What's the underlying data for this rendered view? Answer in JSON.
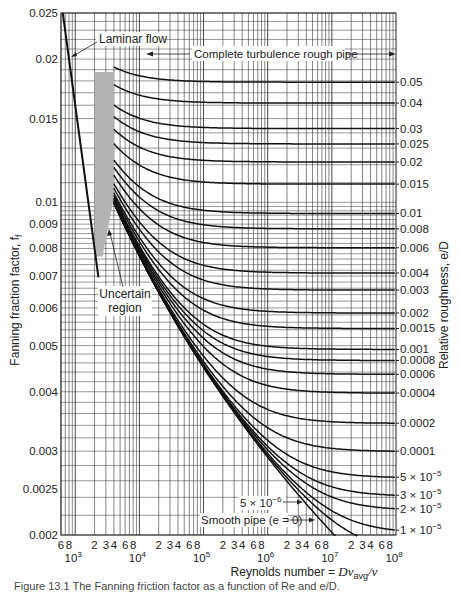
{
  "chart_data": {
    "type": "line",
    "title": "",
    "xlabel": "Reynolds number = Dv_avg/ν",
    "ylabel": "Fanning fraction factor, f_f",
    "y2label": "Relative roughness, e/D",
    "xscale": "log",
    "yscale": "log",
    "xlim": [
      600,
      100000000
    ],
    "ylim": [
      0.002,
      0.025
    ],
    "grid": true,
    "y_ticks": [
      {
        "value": 0.025,
        "label": "0.025"
      },
      {
        "value": 0.02,
        "label": "0.02"
      },
      {
        "value": 0.015,
        "label": "0.015"
      },
      {
        "value": 0.01,
        "label": "0.01"
      },
      {
        "value": 0.009,
        "label": "0.009"
      },
      {
        "value": 0.008,
        "label": "0.008"
      },
      {
        "value": 0.007,
        "label": "0.007"
      },
      {
        "value": 0.006,
        "label": "0.006"
      },
      {
        "value": 0.005,
        "label": "0.005"
      },
      {
        "value": 0.004,
        "label": "0.004"
      },
      {
        "value": 0.003,
        "label": "0.003"
      },
      {
        "value": 0.0025,
        "label": "0.0025"
      },
      {
        "value": 0.002,
        "label": "0.002"
      }
    ],
    "x_minor_labels": [
      "6",
      "8",
      "2",
      "3",
      "4",
      "6",
      "8",
      "2",
      "3",
      "4",
      "6",
      "8",
      "2",
      "3",
      "4",
      "6",
      "8",
      "2",
      "3",
      "4",
      "6",
      "8",
      "2",
      "3",
      "4",
      "6",
      "8"
    ],
    "x_decades": [
      {
        "value": 1000,
        "label": "10",
        "exp": "3"
      },
      {
        "value": 10000,
        "label": "10",
        "exp": "4"
      },
      {
        "value": 100000,
        "label": "10",
        "exp": "5"
      },
      {
        "value": 1000000,
        "label": "10",
        "exp": "6"
      },
      {
        "value": 10000000,
        "label": "10",
        "exp": "7"
      },
      {
        "value": 100000000,
        "label": "10",
        "exp": "8"
      }
    ],
    "series": [
      {
        "name": "Laminar flow",
        "equation": "f = 16/Re",
        "x": [
          600,
          2300
        ],
        "y": [
          0.0267,
          0.00696
        ]
      },
      {
        "name": "0.05",
        "roughness": 0.05
      },
      {
        "name": "0.04",
        "roughness": 0.04
      },
      {
        "name": "0.03",
        "roughness": 0.03
      },
      {
        "name": "0.025",
        "roughness": 0.025
      },
      {
        "name": "0.02",
        "roughness": 0.02
      },
      {
        "name": "0.015",
        "roughness": 0.015
      },
      {
        "name": "0.01",
        "roughness": 0.01
      },
      {
        "name": "0.008",
        "roughness": 0.008
      },
      {
        "name": "0.006",
        "roughness": 0.006
      },
      {
        "name": "0.004",
        "roughness": 0.004
      },
      {
        "name": "0.003",
        "roughness": 0.003
      },
      {
        "name": "0.002",
        "roughness": 0.002
      },
      {
        "name": "0.0015",
        "roughness": 0.0015
      },
      {
        "name": "0.001",
        "roughness": 0.001
      },
      {
        "name": "0.0008",
        "roughness": 0.0008
      },
      {
        "name": "0.0006",
        "roughness": 0.0006
      },
      {
        "name": "0.0004",
        "roughness": 0.0004
      },
      {
        "name": "0.0002",
        "roughness": 0.0002
      },
      {
        "name": "0.0001",
        "roughness": 0.0001
      },
      {
        "name": "5 × 10⁻⁵",
        "roughness": 5e-05
      },
      {
        "name": "3 × 10⁻⁵",
        "roughness": 3e-05
      },
      {
        "name": "2 × 10⁻⁵",
        "roughness": 2e-05
      },
      {
        "name": "1 × 10⁻⁵",
        "roughness": 1e-05
      },
      {
        "name": "5 × 10⁻⁶",
        "roughness": 5e-06,
        "unlabeled_right": true
      },
      {
        "name": "Smooth pipe (e = 0)",
        "roughness": 0,
        "unlabeled_right": true
      }
    ],
    "right_labels": [
      {
        "value": 0.05,
        "label": "0.05"
      },
      {
        "value": 0.04,
        "label": "0.04"
      },
      {
        "value": 0.03,
        "label": "0.03"
      },
      {
        "value": 0.025,
        "label": "0.025"
      },
      {
        "value": 0.02,
        "label": "0.02"
      },
      {
        "value": 0.015,
        "label": "0.015"
      },
      {
        "value": 0.01,
        "label": "0.01"
      },
      {
        "value": 0.008,
        "label": "0.008"
      },
      {
        "value": 0.006,
        "label": "0.006"
      },
      {
        "value": 0.004,
        "label": "0.004"
      },
      {
        "value": 0.003,
        "label": "0.003"
      },
      {
        "value": 0.002,
        "label": "0.002"
      },
      {
        "value": 0.0015,
        "label": "0.0015"
      },
      {
        "value": 0.001,
        "label": "0.001"
      },
      {
        "value": 0.0008,
        "label": "0.0008"
      },
      {
        "value": 0.0006,
        "label": "0.0006"
      },
      {
        "value": 0.0004,
        "label": "0.0004"
      },
      {
        "value": 0.0002,
        "label": "0.0002"
      },
      {
        "value": 0.0001,
        "label": "0.0001"
      },
      {
        "value": 5e-05,
        "label": "5 × 10",
        "exp": "−5"
      },
      {
        "value": 3e-05,
        "label": "3 × 10",
        "exp": "−5"
      },
      {
        "value": 2e-05,
        "label": "2 × 10",
        "exp": "−5"
      },
      {
        "value": 1e-05,
        "label": "1 × 10",
        "exp": "−5"
      }
    ],
    "annotations": [
      {
        "text": "Laminar flow",
        "target": "laminar line"
      },
      {
        "text": "Complete turbulence rough pipe",
        "type": "double-arrow span"
      },
      {
        "text": "Uncertain region",
        "target": "shaded band Re≈2000–4000"
      },
      {
        "text": "5 × 10⁻⁶",
        "target": "curve e/D = 5e-6"
      },
      {
        "text": "Smooth pipe (e = 0)",
        "target": "smooth curve"
      }
    ],
    "uncertain_region": {
      "re_range": [
        2000,
        4000
      ],
      "color": "#b3b3b3"
    }
  },
  "labels": {
    "laminar": "Laminar flow",
    "complete_turbulence": "Complete turbulence rough pipe",
    "uncertain_line1": "Uncertain",
    "uncertain_line2": "region",
    "eps5e6": "5 × 10",
    "eps5e6_exp": "−6",
    "smooth": "Smooth pipe (e = 0)",
    "xlabel_prefix": "Reynolds number = ",
    "xlabel_var": "Dv",
    "xlabel_sub": "avg",
    "xlabel_suffix": "/ν",
    "ylabel": "Fanning fraction factor, f",
    "ylabel_sub": "f",
    "y2label": "Relative roughness, e/D"
  },
  "caption": "Figure 13.1  The Fanning friction factor as a function of Re and e/D."
}
